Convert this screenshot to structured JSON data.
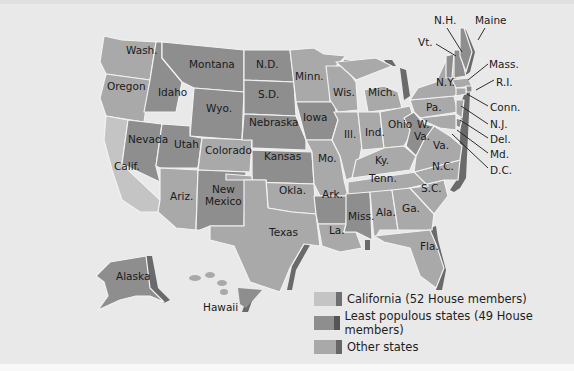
{
  "colors": {
    "california": "#c4c4c4",
    "least_populous": "#8e8e8e",
    "other": "#a9a9a9",
    "shadow": "#6a6a6a",
    "background": "#e9e9e9"
  },
  "states": {
    "wash": "Wash.",
    "oregon": "Oregon",
    "calif": "Calif.",
    "idaho": "Idaho",
    "nevada": "Nevada",
    "montana": "Montana",
    "wyo": "Wyo.",
    "utah": "Utah",
    "ariz": "Ariz.",
    "colorado": "Colorado",
    "new": "New",
    "mexico": "Mexico",
    "nd": "N.D.",
    "sd": "S.D.",
    "nebraska": "Nebraska",
    "kansas": "Kansas",
    "okla": "Okla.",
    "texas": "Texas",
    "minn": "Minn.",
    "iowa": "Iowa",
    "mo": "Mo.",
    "ark": "Ark.",
    "la": "La.",
    "wis": "Wis.",
    "ill": "Ill.",
    "mich": "Mich.",
    "ind": "Ind.",
    "ohio": "Ohio",
    "ky": "Ky.",
    "tenn": "Tenn.",
    "miss": "Miss.",
    "ala": "Ala.",
    "ga": "Ga.",
    "fla": "Fla.",
    "sc": "S.C.",
    "nc": "N.C.",
    "va": "Va.",
    "w": "W.",
    "va2": "Va.",
    "pa": "Pa.",
    "ny": "N.Y.",
    "vt": "Vt.",
    "nh": "N.H.",
    "maine": "Maine",
    "mass": "Mass.",
    "ri": "R.I.",
    "conn": "Conn.",
    "nj": "N.J.",
    "del": "Del.",
    "md": "Md.",
    "dc": "D.C.",
    "alaska": "Alaska",
    "hawaii": "Hawaii"
  },
  "legend": {
    "items": [
      {
        "label": "California (52 House members)",
        "category": "california"
      },
      {
        "label": "Least populous states (49 House members)",
        "category": "least_populous"
      },
      {
        "label": "Other states",
        "category": "other"
      }
    ]
  }
}
